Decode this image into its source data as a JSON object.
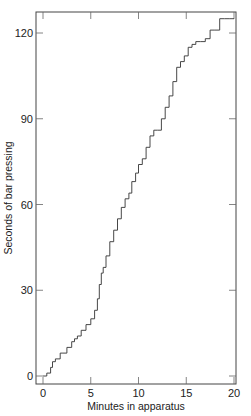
{
  "chart_data": {
    "type": "line",
    "title": "",
    "xlabel": "Minutes in apparatus",
    "ylabel": "Seconds of bar pressing",
    "xlim": [
      0,
      20
    ],
    "ylim": [
      0,
      125
    ],
    "xticks": [
      0,
      5,
      10,
      15,
      20
    ],
    "yticks": [
      0,
      30,
      60,
      90,
      120
    ],
    "grid": false,
    "legend": null,
    "series": [
      {
        "name": "cumulative bar pressing",
        "x": [
          0,
          0.4,
          0.8,
          1.0,
          1.3,
          1.8,
          2.0,
          2.5,
          3.0,
          3.3,
          3.6,
          4.0,
          4.5,
          5.0,
          5.4,
          5.7,
          5.9,
          6.1,
          6.3,
          6.6,
          7.0,
          7.4,
          7.8,
          8.2,
          8.6,
          9.0,
          9.3,
          9.7,
          10.0,
          10.4,
          10.8,
          11.2,
          11.6,
          12.0,
          12.4,
          12.8,
          13.2,
          13.6,
          14.0,
          14.4,
          14.8,
          15.2,
          15.6,
          16.0,
          16.5,
          17.0,
          17.5,
          18.0,
          18.5,
          19.0,
          19.5,
          20.0
        ],
        "y": [
          0,
          1,
          3,
          5,
          6,
          8,
          8,
          10,
          12,
          13,
          14,
          16,
          18,
          20,
          23,
          27,
          32,
          36,
          38,
          42,
          47,
          51,
          55,
          59,
          62,
          64,
          68,
          71,
          74,
          76,
          80,
          84,
          86,
          86,
          90,
          94,
          98,
          103,
          108,
          110,
          112,
          115,
          116,
          117,
          117,
          118,
          121,
          121,
          125,
          125,
          125,
          125
        ]
      }
    ]
  }
}
